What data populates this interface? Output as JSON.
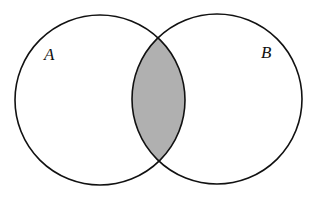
{
  "diagram": {
    "type": "venn",
    "sets": [
      {
        "label": "A",
        "cx": 100,
        "cy": 100,
        "r": 85
      },
      {
        "label": "B",
        "cx": 217,
        "cy": 99,
        "r": 85
      }
    ],
    "shaded_region": "A ∩ B",
    "shade_color": "#b0b0b0",
    "stroke_color": "#111111"
  }
}
